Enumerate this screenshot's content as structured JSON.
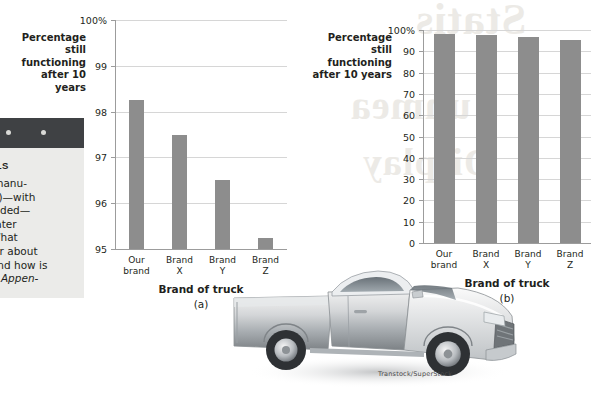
{
  "margin_note": {
    "heading": "BELS",
    "lines": [
      "ck manu-",
      "h (a)—with",
      "ncluded—",
      " greater",
      "s. What",
      " clear about",
      "y, and how is",
      "See Appen-"
    ]
  },
  "credit": "Transtock/SuperStock",
  "bleed_text": {
    "line1": "Statis",
    "line2": "unmea",
    "line3": "Display"
  },
  "colors": {
    "bar": "#8d8d8d",
    "axis": "#9c9c9c",
    "grid": "#d6d6d6",
    "text": "#231f20",
    "margin_panel": "#ebebe9",
    "margin_photo": "#3f4144"
  },
  "chart_data": [
    {
      "type": "bar",
      "panel": "(a)",
      "title": "",
      "ylabel": "Percentage still functioning after 10 years",
      "ylabel_lines": [
        "Percentage",
        "still functioning",
        "after 10 years"
      ],
      "xlabel": "Brand of truck",
      "categories": [
        "Our brand",
        "Brand X",
        "Brand Y",
        "Brand Z"
      ],
      "category_lines": [
        [
          "Our",
          "brand"
        ],
        [
          "Brand",
          "X"
        ],
        [
          "Brand",
          "Y"
        ],
        [
          "Brand",
          "Z"
        ]
      ],
      "values": [
        98.25,
        97.5,
        96.5,
        95.25
      ],
      "ylim": [
        95,
        100
      ],
      "yticks": [
        95,
        96,
        97,
        98,
        99,
        100
      ],
      "ytick_labels": [
        "95",
        "96",
        "97",
        "98",
        "99",
        "100%"
      ],
      "grid": true,
      "legend": "none"
    },
    {
      "type": "bar",
      "panel": "(b)",
      "title": "",
      "ylabel": "Percentage still functioning after 10 years",
      "ylabel_lines": [
        "Percentage",
        "still functioning",
        "after 10 years"
      ],
      "xlabel": "Brand of truck",
      "categories": [
        "Our brand",
        "Brand X",
        "Brand Y",
        "Brand Z"
      ],
      "category_lines": [
        [
          "Our",
          "brand"
        ],
        [
          "Brand",
          "X"
        ],
        [
          "Brand",
          "Y"
        ],
        [
          "Brand",
          "Z"
        ]
      ],
      "values": [
        98.25,
        97.5,
        96.5,
        95.25
      ],
      "ylim": [
        0,
        100
      ],
      "yticks": [
        0,
        10,
        20,
        30,
        40,
        50,
        60,
        70,
        80,
        90,
        100
      ],
      "ytick_labels": [
        "0",
        "10",
        "20",
        "30",
        "40",
        "50",
        "60",
        "70",
        "80",
        "90",
        "100%"
      ],
      "grid": true,
      "legend": "none"
    }
  ]
}
